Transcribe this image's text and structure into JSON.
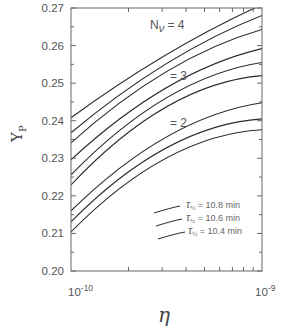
{
  "chart_data": {
    "type": "line",
    "title": "",
    "xlabel": "η",
    "ylabel": "Y_P",
    "xscale": "log",
    "xlim": [
      1e-10,
      1e-09
    ],
    "ylim": [
      0.2,
      0.27
    ],
    "x_tick_labels": [
      {
        "base": "10",
        "exp": "-10",
        "value": 1e-10
      },
      {
        "base": "10",
        "exp": "-9",
        "value": 1e-09
      }
    ],
    "y_tick_labels": [
      "0.20",
      "0.21",
      "0.22",
      "0.23",
      "0.24",
      "0.25",
      "0.26",
      "0.27"
    ],
    "y_ticks": [
      0.2,
      0.21,
      0.22,
      0.23,
      0.24,
      0.25,
      0.26,
      0.27
    ],
    "grid": false,
    "x": [
      1e-10,
      3.162e-10,
      1e-09
    ],
    "series": [
      {
        "name": "N_ν=4, τ½=10.8 min",
        "values": [
          0.2408,
          0.2576,
          0.2709
        ]
      },
      {
        "name": "N_ν=4, τ½=10.6 min",
        "values": [
          0.2368,
          0.2552,
          0.268
        ]
      },
      {
        "name": "N_ν=4, τ½=10.4 min",
        "values": [
          0.2341,
          0.2531,
          0.2643
        ]
      },
      {
        "name": "N_ν=3, τ½=10.8 min",
        "values": [
          0.2296,
          0.2488,
          0.2592
        ]
      },
      {
        "name": "N_ν=3, τ½=10.6 min",
        "values": [
          0.2256,
          0.2461,
          0.2555
        ]
      },
      {
        "name": "N_ν=3, τ½=10.4 min",
        "values": [
          0.2229,
          0.2437,
          0.252
        ]
      },
      {
        "name": "N_ν=2, τ½=10.8 min",
        "values": [
          0.216,
          0.2357,
          0.2448
        ]
      },
      {
        "name": "N_ν=2, τ½=10.6 min",
        "values": [
          0.2131,
          0.2328,
          0.2405
        ]
      },
      {
        "name": "N_ν=2, τ½=10.4 min",
        "values": [
          0.2104,
          0.2301,
          0.2376
        ]
      }
    ],
    "annotations": [
      {
        "text_main": "N",
        "text_sub": "ν",
        "text_rest": " = 4"
      },
      {
        "text": "= 3"
      },
      {
        "text": "= 2"
      }
    ],
    "legend": {
      "position": "lower right",
      "entries": [
        {
          "symbol": "τ",
          "sub": "½",
          "label": " = 10.8 min"
        },
        {
          "symbol": "τ",
          "sub": "½",
          "label": " = 10.6 min"
        },
        {
          "symbol": "τ",
          "sub": "½",
          "label": " = 10.4 min"
        }
      ]
    },
    "colors": {
      "line": "#2a2a2a",
      "axis": "#555555",
      "text": "#555555"
    }
  }
}
